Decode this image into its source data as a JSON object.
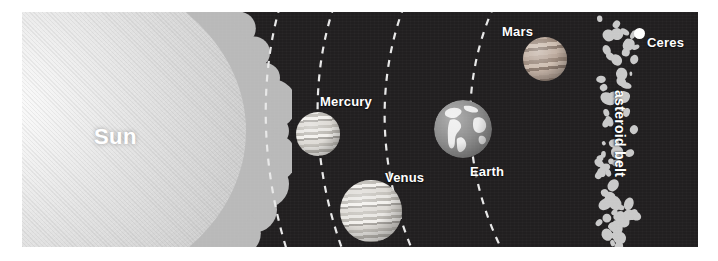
{
  "diagram": {
    "background_color": "#211f20",
    "margin_color": "#ffffff",
    "label_color": "#ffffff",
    "orbit_line_color": "#e8e8e8",
    "orbit_line_style": "dashed"
  },
  "sun": {
    "label": "Sun",
    "body_color": "#e3e3e3",
    "corona_color": "#b9b9b9",
    "position": "left edge, partially off-frame"
  },
  "planets": [
    {
      "name": "Mercury",
      "label": "Mercury",
      "order": 1,
      "texture": "banded",
      "label_position": "above-right"
    },
    {
      "name": "Venus",
      "label": "Venus",
      "order": 2,
      "texture": "banded",
      "label_position": "above-right"
    },
    {
      "name": "Earth",
      "label": "Earth",
      "order": 3,
      "texture": "continents",
      "label_position": "below-right"
    },
    {
      "name": "Mars",
      "label": "Mars",
      "order": 4,
      "texture": "banded-dark",
      "label_position": "above-left"
    }
  ],
  "orbits": {
    "count": 4,
    "labels": [
      "Mercury orbit",
      "Venus orbit",
      "Earth orbit",
      "Mars orbit"
    ]
  },
  "asteroid_belt": {
    "label": "asteroid belt",
    "label_orientation": "vertical",
    "asteroid_color": "#c9c9c9",
    "asteroid_count": 74
  },
  "ceres": {
    "label": "Ceres",
    "dot_color": "#ffffff"
  }
}
